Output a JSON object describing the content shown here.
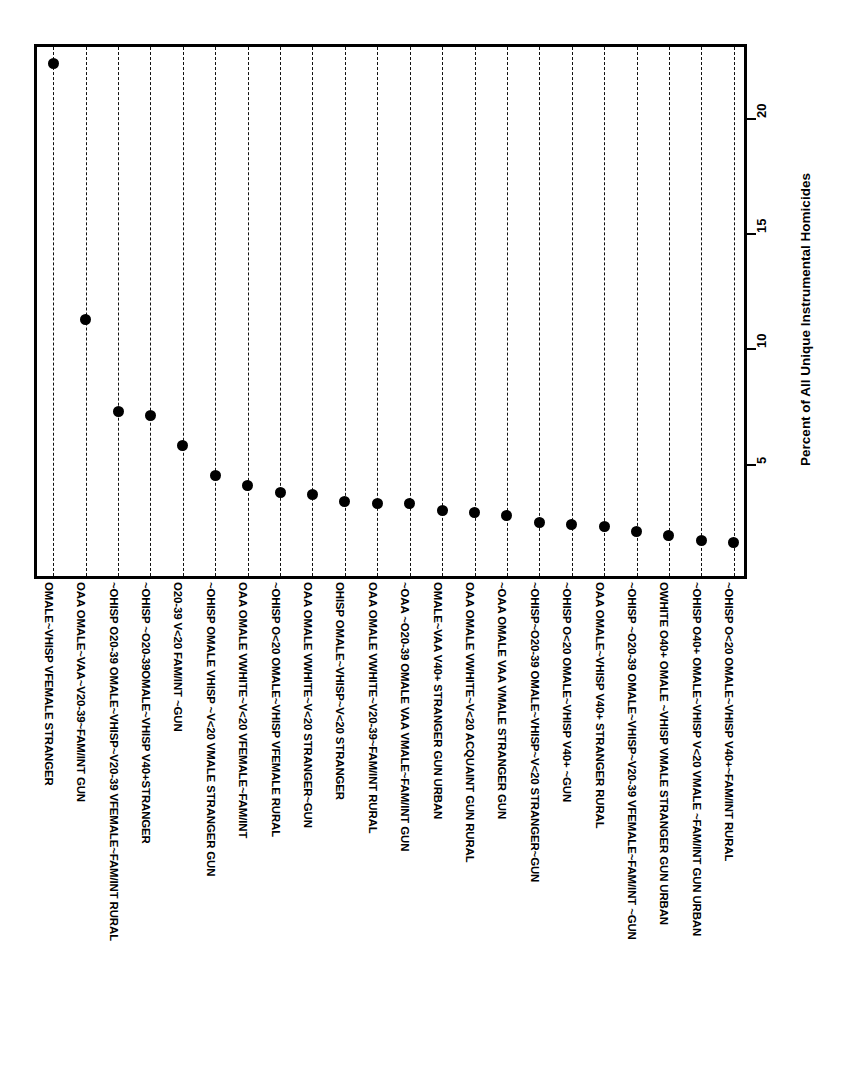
{
  "chart_data": {
    "type": "scatter",
    "title": "",
    "subtitle": "",
    "xlabel": "",
    "ylabel": "Percent of All Unique Instrumental Homicides",
    "orientation": "vertical-droplines",
    "grid": "dashed-droplines-per-category",
    "legend": "none",
    "ylim": [
      0,
      23.2
    ],
    "yticks": [
      5,
      10,
      15,
      20
    ],
    "ytick_labels": [
      "5",
      "10",
      "15",
      "20"
    ],
    "categories": [
      "OMALE~VHISP VFEMALE STRANGER",
      "OAA OMALE~VAA~V20-39~FAM/INT GUN",
      "~OHISP O20-39 OMALE~VHISP~V20-39 VFEMALE~FAM/INT RURAL",
      "~OHISP ~O20-39OMALE~VHISP V40+STRANGER",
      "O20-39 V<20 FAM/INT ~GUN",
      "~OHISP OMALE VHISP ~V<20 VMALE STRANGER GUN",
      "OAA OMALE VWHITE~V<20 VFEMALE~FAM/INT",
      "~OHISP O<20 OMALE~VHISP VFEMALE RURAL",
      "OAA OMALE VWHITE~V<20 STRANGER~GUN",
      "OHISP OMALE~VHISP~V<20 STRANGER",
      "OAA OMALE VWHITE~V20-39~FAM/INT RURAL",
      "~OAA ~O20-39 OMALE VAA VMALE~FAM/INT GUN",
      "OMALE~VAA V40+ STRANGER GUN URBAN",
      "OAA OMALE VWHITE~V<20 ACQUAINT GUN RURAL",
      "~OAA OMALE VAA VMALE STRANGER GUN",
      "~OHISP~O20-39 OMALE~VHISP~V<20 STRANGER~GUN",
      "~OHISP O<20 OMALE~VHISP V40+ ~GUN",
      "OAA OMALE~VHISP V40+ STRANGER RURAL",
      "~OHISP ~O20-39 OMALE~VHISP~V20-39 VFEMALE~FAM/INT ~GUN",
      "OWHITE O40+ OMALE ~VHISP VMALE STRANGER GUN URBAN",
      "~OHISP O40+ OMALE~VHISP V<20 VMALE ~FAM/INT GUN URBAN",
      "~OHISP O<20 OMALE~VHISP V40+~FAM/INT RURAL"
    ],
    "values": [
      22.5,
      11.4,
      7.4,
      7.2,
      5.9,
      4.6,
      4.2,
      3.9,
      3.8,
      3.5,
      3.4,
      3.4,
      3.1,
      3.0,
      2.9,
      2.6,
      2.5,
      2.4,
      2.2,
      2.0,
      1.8,
      1.7
    ]
  },
  "axis": {
    "value_axis_title": "Percent of All Unique Instrumental Homicides"
  }
}
